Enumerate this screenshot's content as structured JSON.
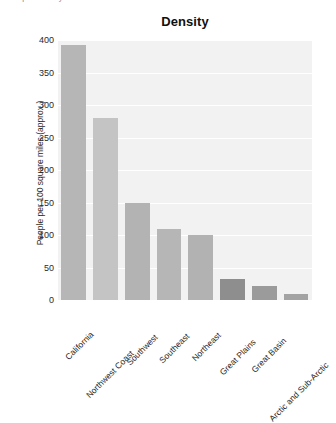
{
  "clipped_header": {
    "text": "the process by which one becomes"
  },
  "chart_data": {
    "type": "bar",
    "title": "Density",
    "xlabel": "",
    "ylabel": "People per 100 square miles (approx.)",
    "ylim": [
      0,
      400
    ],
    "yticks": [
      0,
      50,
      100,
      150,
      200,
      250,
      300,
      350,
      400
    ],
    "ytick_labels": [
      "0",
      "50",
      "100",
      "150",
      "200",
      "250",
      "300",
      "350",
      "400"
    ],
    "grid": true,
    "grid_axis": "y",
    "legend": null,
    "categories": [
      "California",
      "Northwest Coast",
      "Southwest",
      "Southeast",
      "Northeast",
      "Great Plains",
      "Great Basin",
      "Arctic and Sub-Arctic"
    ],
    "values": [
      393,
      280,
      150,
      110,
      100,
      32,
      22,
      10
    ],
    "bar_colors": [
      "#b6b6b6",
      "#c4c4c4",
      "#b3b3b3",
      "#b6b6b6",
      "#b2b2b2",
      "#8e8e8e",
      "#9b9b9b",
      "#a3a3a3"
    ]
  },
  "colors": {
    "plot_background": "#f2f2f2",
    "page_background": "#ffffff",
    "gridline": "#ffffff",
    "text": "#1f1f1f"
  }
}
